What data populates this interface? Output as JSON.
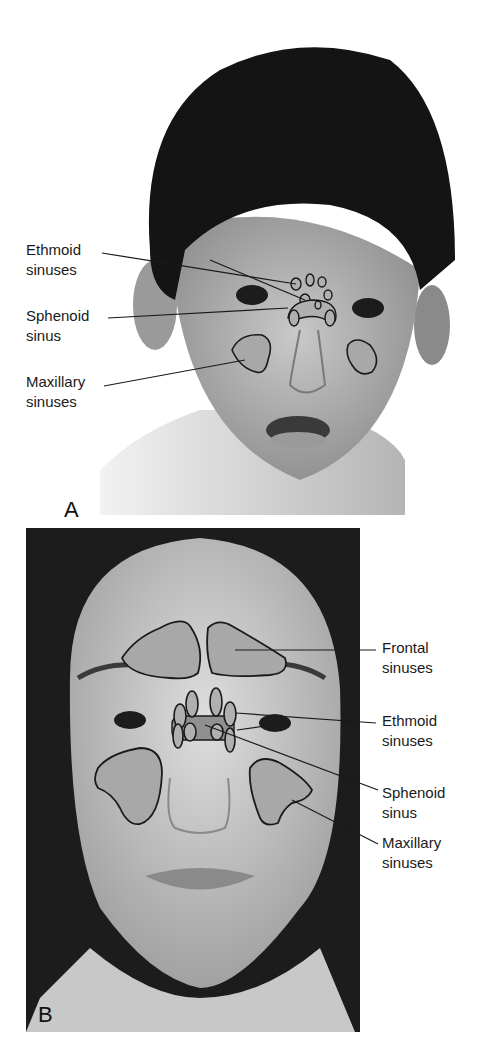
{
  "figure": {
    "panels": [
      {
        "letter": "A",
        "subject": "child-face",
        "labels": [
          {
            "text": "Ethmoid\nsinuses"
          },
          {
            "text": "Sphenoid\nsinus"
          },
          {
            "text": "Maxillary\nsinuses"
          }
        ]
      },
      {
        "letter": "B",
        "subject": "adult-face",
        "labels": [
          {
            "text": "Frontal\nsinuses"
          },
          {
            "text": "Ethmoid\nsinuses"
          },
          {
            "text": "Sphenoid\nsinus"
          },
          {
            "text": "Maxillary\nsinuses"
          }
        ]
      }
    ],
    "colors": {
      "sinus_fill": "#a8a8a8",
      "outline": "#1a1a1a",
      "hair": "#141414",
      "skin": "#bdbdbd"
    }
  }
}
